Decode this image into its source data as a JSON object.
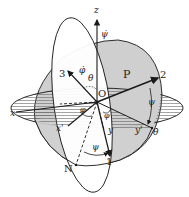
{
  "diagram": {
    "axes": {
      "z": "z",
      "x": "x",
      "y": "y",
      "x_prime": "x'",
      "y_prime": "y'",
      "body_1": "1",
      "body_2": "2",
      "body_3": "3"
    },
    "points": {
      "origin": "O",
      "node": "N",
      "plane": "P"
    },
    "angles": {
      "phi": "φ",
      "psi": "ψ",
      "theta": "θ",
      "phi_dot": "φ̇",
      "psi_dot": "ψ̇",
      "theta_dot": "θ̇"
    },
    "colors": {
      "line": "#1a1a1a",
      "shaded_plane": "#cfcfcf",
      "hatch": "#555555",
      "background": "#ffffff"
    }
  }
}
